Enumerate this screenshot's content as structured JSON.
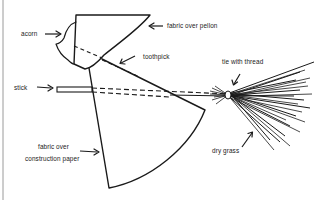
{
  "diagram": {
    "type": "craft-assembly-illustration",
    "labels": {
      "acorn": "acorn",
      "fabric_over_pellon": "fabric over pellon",
      "toothpick": "toothpick",
      "stick": "stick",
      "tie_with_thread": "tie with thread",
      "fabric_over_construction_paper_line1": "fabric over",
      "fabric_over_construction_paper_line2": "construction paper",
      "dry_grass": "dry grass"
    },
    "colors": {
      "ink": "#1a1a1a",
      "border": "#9a9a9a",
      "background": "#ffffff"
    }
  }
}
